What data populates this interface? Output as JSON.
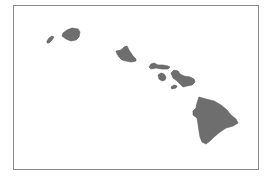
{
  "map": {
    "subject": "Hawaiian Islands",
    "colors": {
      "land": "#6e6e6e",
      "water": "#ffffff",
      "border": "#8a8a8a"
    },
    "islands": [
      {
        "name": "Niihau"
      },
      {
        "name": "Kauai"
      },
      {
        "name": "Oahu"
      },
      {
        "name": "Molokai"
      },
      {
        "name": "Lanai"
      },
      {
        "name": "Maui"
      },
      {
        "name": "Kahoolawe"
      },
      {
        "name": "Hawaii"
      }
    ]
  }
}
